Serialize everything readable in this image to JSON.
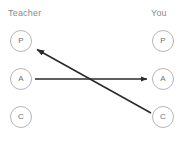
{
  "diagram": {
    "title_left": "Teacher",
    "title_right": "You",
    "columns": [
      {
        "id": "teacher",
        "label": "Teacher",
        "nodes": [
          {
            "id": "teacher-p",
            "letter": "P",
            "name": "Parent"
          },
          {
            "id": "teacher-a",
            "letter": "A",
            "name": "Adult"
          },
          {
            "id": "teacher-c",
            "letter": "C",
            "name": "Child"
          }
        ]
      },
      {
        "id": "you",
        "label": "You",
        "nodes": [
          {
            "id": "you-p",
            "letter": "P",
            "name": "Parent"
          },
          {
            "id": "you-a",
            "letter": "A",
            "name": "Adult"
          },
          {
            "id": "you-c",
            "letter": "C",
            "name": "Child"
          }
        ]
      }
    ],
    "arrows": [
      {
        "id": "arrow-adult-to-adult",
        "from": "teacher-a",
        "to": "you-a",
        "direction": "left-to-right",
        "style": "straight-horizontal"
      },
      {
        "id": "arrow-child-to-parent",
        "from": "you-c",
        "to": "teacher-p",
        "direction": "right-to-left",
        "style": "diagonal-crossed"
      }
    ],
    "colors": {
      "node_stroke": "#b6b6b6",
      "node_text": "#6f6f6f",
      "label_text": "#8b8b8b",
      "arrow": "#2b2b2b",
      "background": "#ffffff"
    }
  }
}
